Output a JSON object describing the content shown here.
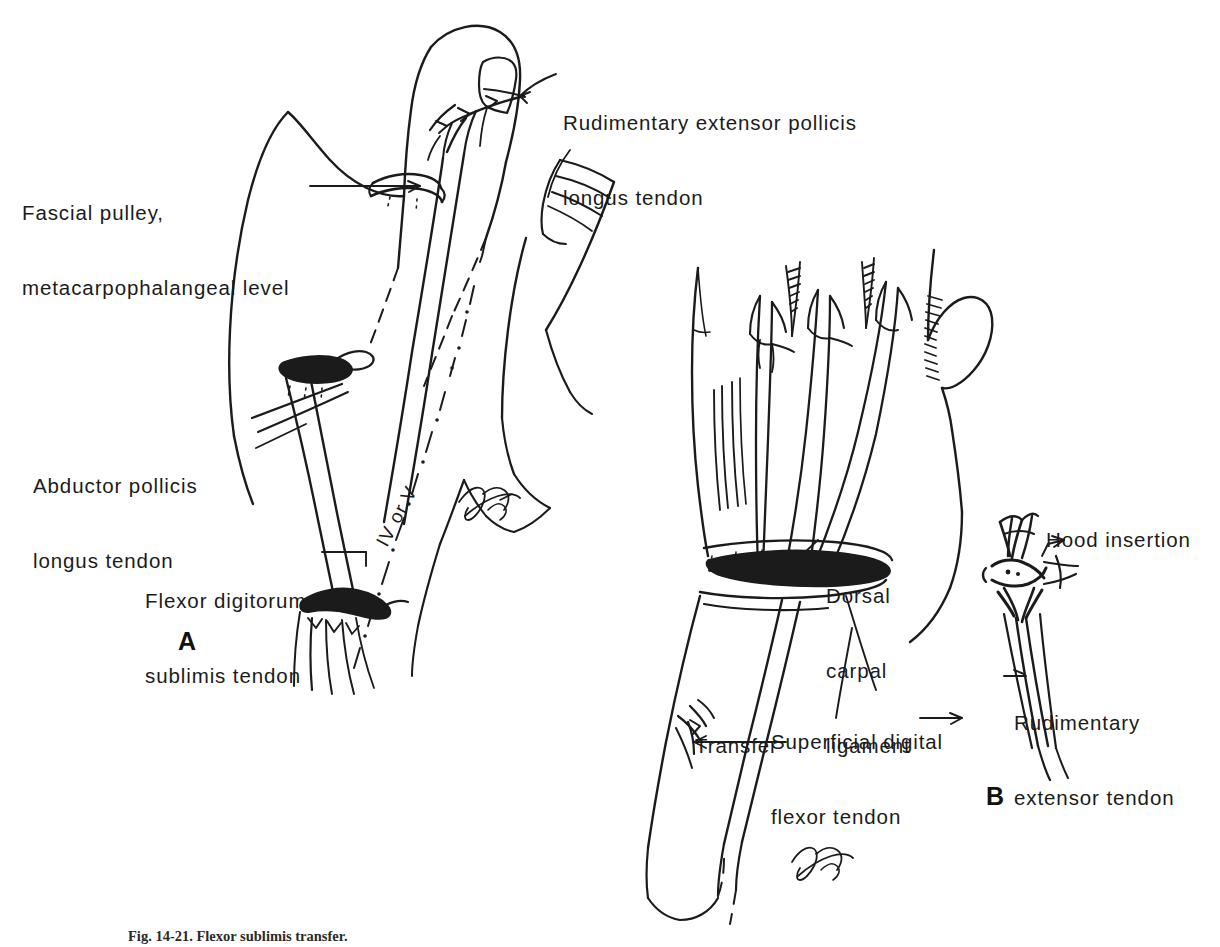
{
  "figure": {
    "caption": "Fig. 14-21. Flexor sublimis transfer.",
    "ink_color": "#1b1b1b",
    "background_color": "#ffffff"
  },
  "panels": [
    {
      "id": "A",
      "letter": "A",
      "description": "Dorsal view of thumb and hand with fascial pulley and tendon transfer"
    },
    {
      "id": "B",
      "letter": "B",
      "description": "Dorsal view of wrist and hand with dorsal carpal ligament and rudimentary extensor tendon"
    }
  ],
  "labels": {
    "rudimentary_extensor_pollicis_longus": {
      "line1": "Rudimentary extensor pollicis",
      "line2": "longus tendon"
    },
    "fascial_pulley": {
      "line1": "Fascial pulley,",
      "line2": "metacarpophalangeal level"
    },
    "abductor_pollicis_longus": {
      "line1": "Abductor pollicis",
      "line2": "longus tendon"
    },
    "flexor_digitorum_sublimis": {
      "line1": "Flexor digitorum",
      "line2": "sublimis tendon"
    },
    "digit_annotation": "IV or V",
    "dorsal_carpal_ligament": {
      "line1": "Dorsal",
      "line2": "carpal",
      "line3": "ligament"
    },
    "transfer": "Transfer",
    "superficial_digital_flexor": {
      "line1": "Superficial digital",
      "line2": "flexor tendon"
    },
    "hood_insertion": "Hood insertion",
    "rudimentary_extensor_tendon": {
      "line1": "Rudimentary",
      "line2": "extensor tendon"
    }
  }
}
